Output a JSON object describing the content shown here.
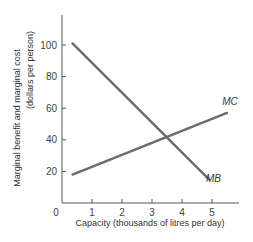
{
  "chart_data": {
    "type": "line",
    "title": "",
    "xlabel": "Capacity (thousands of litres per day)",
    "ylabel_line1": "Marginal benefit and marginal cost",
    "ylabel_line2": "(dollars per person)",
    "xlim": [
      0,
      5.8
    ],
    "ylim": [
      0,
      120
    ],
    "x_ticks": [
      0,
      1,
      2,
      3,
      4,
      5
    ],
    "y_ticks": [
      20,
      40,
      60,
      80,
      100
    ],
    "grid": false,
    "series": [
      {
        "name": "MB",
        "x": [
          0.35,
          4.9
        ],
        "y": [
          101,
          15
        ],
        "color": "#6b6b6b"
      },
      {
        "name": "MC",
        "x": [
          0.35,
          5.5
        ],
        "y": [
          18,
          57
        ],
        "color": "#6b6b6b"
      }
    ],
    "annotations": [
      {
        "text": "MC",
        "x": 5.6,
        "y": 62
      },
      {
        "text": "MB",
        "x": 5.05,
        "y": 13
      }
    ]
  }
}
